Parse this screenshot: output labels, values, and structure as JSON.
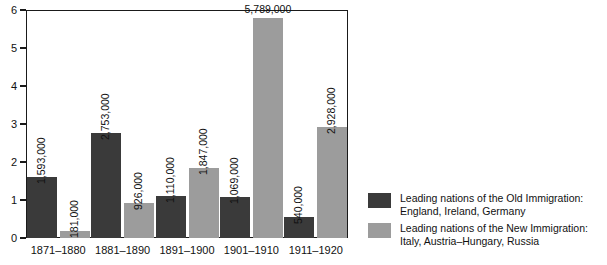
{
  "chart_data": {
    "type": "bar",
    "title": "",
    "subtitle": "",
    "xlabel": "",
    "ylabel": "",
    "ylim": [
      0,
      6
    ],
    "yticks": [
      "0",
      "1",
      "2",
      "3",
      "4",
      "5",
      "6"
    ],
    "grid": false,
    "legend_position": "right",
    "categories": [
      "1871–1880",
      "1881–1890",
      "1891–1900",
      "1901–1910",
      "1911–1920"
    ],
    "series": [
      {
        "name": "Leading nations of the Old Immigration: England, Ireland, Germany",
        "color": "#3a3a3a",
        "values": [
          1.593,
          2.753,
          1.11,
          1.069,
          0.54
        ],
        "labels": [
          "1,593,000",
          "2,753,000",
          "1,110,000",
          "1,069,000",
          "540,000"
        ]
      },
      {
        "name": "Leading nations of the New Immigration: Italy, Austria–Hungary, Russia",
        "color": "#9c9c9c",
        "values": [
          0.181,
          0.926,
          1.847,
          5.789,
          2.928
        ],
        "labels": [
          "181,000",
          "926,000",
          "1,847,000",
          "5,789,000",
          "2,928,000"
        ]
      }
    ],
    "value_units": "millions of immigrants"
  },
  "legend": {
    "entries": [
      {
        "swatch": "old-immigration-swatch",
        "line1": "Leading nations of the Old Immigration:",
        "line2": "England, Ireland, Germany"
      },
      {
        "swatch": "new-immigration-swatch",
        "line1": "Leading nations of the New Immigration:",
        "line2": "Italy, Austria–Hungary, Russia"
      }
    ]
  }
}
